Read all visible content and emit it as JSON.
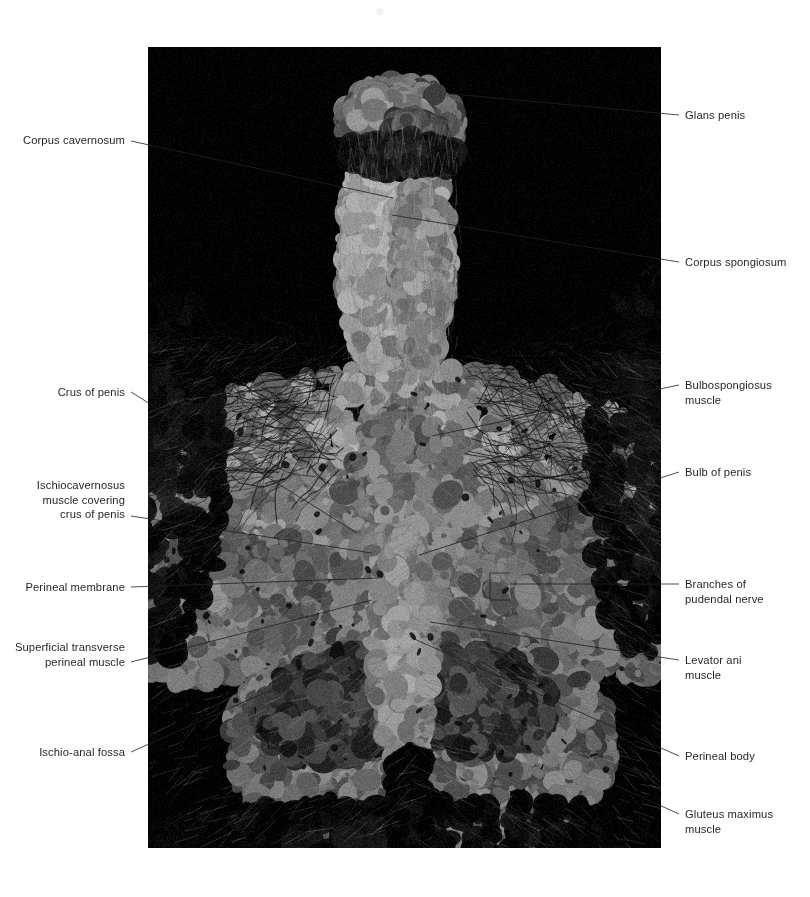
{
  "figure": {
    "type": "anatomical-dissection-photograph",
    "photo": {
      "x": 148,
      "y": 47,
      "width": 513,
      "height": 801,
      "background_color": "#000000",
      "palette": {
        "black": "#000000",
        "deep_shadow": "#1b1b1b",
        "mid_tissue": "#8d8a84",
        "pale_tissue": "#cfcac1",
        "highlight": "#efece6",
        "hair": "#2a2724"
      }
    },
    "leader_color": "#231f20",
    "leader_width": 0.8
  },
  "labels": [
    {
      "id": "corpus-cavernosum",
      "text": "Corpus cavernosum",
      "side": "left",
      "text_x": 125,
      "text_y": 133,
      "leader": [
        [
          131,
          141
        ],
        [
          393,
          198
        ]
      ]
    },
    {
      "id": "crus-of-penis",
      "text": "Crus of penis",
      "side": "left",
      "text_x": 125,
      "text_y": 385,
      "leader": [
        [
          131,
          392
        ],
        [
          357,
          533
        ]
      ]
    },
    {
      "id": "ischiocavernosus-muscle",
      "text": "Ischiocavernosus\nmuscle covering\ncrus of penis",
      "side": "left",
      "text_x": 125,
      "text_y": 478,
      "leader": [
        [
          131,
          516
        ],
        [
          372,
          553
        ]
      ]
    },
    {
      "id": "perineal-membrane",
      "text": "Perineal membrane",
      "side": "left",
      "text_x": 125,
      "text_y": 580,
      "leader": [
        [
          131,
          587
        ],
        [
          378,
          578
        ]
      ]
    },
    {
      "id": "superficial-transverse-perineal-muscle",
      "text": "Superficial transverse\nperineal muscle",
      "side": "left",
      "text_x": 125,
      "text_y": 640,
      "leader": [
        [
          131,
          662
        ],
        [
          372,
          600
        ]
      ]
    },
    {
      "id": "ischio-anal-fossa",
      "text": "Ischio-anal fossa",
      "side": "left",
      "text_x": 125,
      "text_y": 745,
      "leader": [
        [
          131,
          752
        ],
        [
          345,
          657
        ]
      ]
    },
    {
      "id": "glans-penis",
      "text": "Glans penis",
      "side": "right",
      "text_x": 685,
      "text_y": 108,
      "leader": [
        [
          679,
          115
        ],
        [
          453,
          94
        ]
      ]
    },
    {
      "id": "corpus-spongiosum",
      "text": "Corpus spongiosum",
      "side": "right",
      "text_x": 685,
      "text_y": 255,
      "leader": [
        [
          679,
          262
        ],
        [
          392,
          215
        ]
      ]
    },
    {
      "id": "bulbospongiosus-muscle",
      "text": "Bulbospongiosus\nmuscle",
      "side": "right",
      "text_x": 685,
      "text_y": 378,
      "leader": [
        [
          679,
          385
        ],
        [
          432,
          436
        ]
      ]
    },
    {
      "id": "bulb-of-penis",
      "text": "Bulb of penis",
      "side": "right",
      "text_x": 685,
      "text_y": 465,
      "leader": [
        [
          679,
          472
        ],
        [
          419,
          555
        ]
      ]
    },
    {
      "id": "branches-of-pudendal-nerve",
      "text": "Branches of\npudendal nerve",
      "side": "right",
      "text_x": 685,
      "text_y": 577,
      "leader": [
        [
          679,
          584
        ],
        [
          510,
          584
        ]
      ],
      "bracket": {
        "x": 490,
        "y_top": 573,
        "y_bottom": 600,
        "x_end": 510
      }
    },
    {
      "id": "levator-ani-muscle",
      "text": "Levator ani\nmuscle",
      "side": "right",
      "text_x": 685,
      "text_y": 653,
      "leader": [
        [
          679,
          660
        ],
        [
          430,
          622
        ]
      ]
    },
    {
      "id": "perineal-body",
      "text": "Perineal body",
      "side": "right",
      "text_x": 685,
      "text_y": 749,
      "leader": [
        [
          679,
          756
        ],
        [
          412,
          638
        ]
      ]
    },
    {
      "id": "gluteus-maximus-muscle",
      "text": "Gluteus maximus\nmuscle",
      "side": "right",
      "text_x": 685,
      "text_y": 807,
      "leader": [
        [
          679,
          814
        ],
        [
          615,
          785
        ]
      ]
    }
  ]
}
